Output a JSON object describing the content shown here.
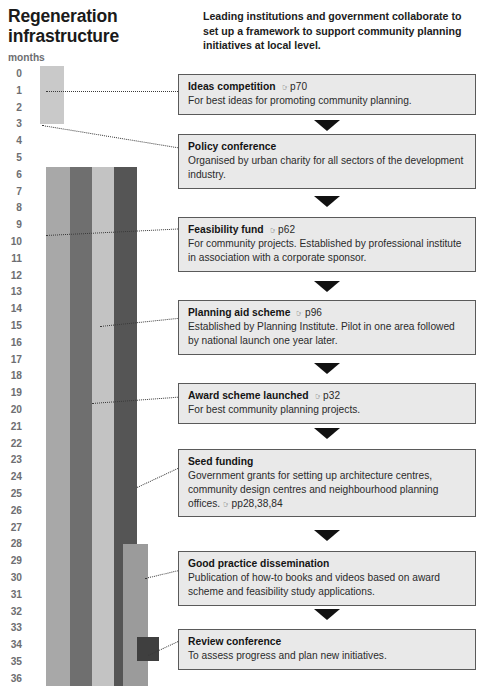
{
  "title": "Regeneration infrastructure",
  "intro": "Leading institutions and government collaborate to set up a framework to support community planning initiatives at local level.",
  "axis": {
    "label": "months",
    "ticks": [
      "0",
      "1",
      "2",
      "3",
      "4",
      "5",
      "6",
      "7",
      "8",
      "9",
      "10",
      "11",
      "12",
      "13",
      "14",
      "15",
      "16",
      "17",
      "18",
      "19",
      "20",
      "21",
      "22",
      "23",
      "24",
      "25",
      "26",
      "27",
      "28",
      "29",
      "30",
      "31",
      "32",
      "33",
      "34",
      "35",
      "36"
    ]
  },
  "icons": {
    "page_ref": "☞"
  },
  "colors": {
    "bar_light": "#c9c9c9",
    "bar_mid_light": "#a8a8a8",
    "bar_mid": "#9b9b9b",
    "bar_dark": "#6f6f6f",
    "bar_lightest": "#c3c3c3",
    "bar_darkest": "#555555",
    "box_fill": "#e9e9e9",
    "box_border": "#5a5a5a",
    "axis_text": "#6d6e71"
  },
  "chart_data": {
    "type": "bar",
    "title": "Regeneration infrastructure",
    "orientation": "vertical-timeline",
    "xlabel": "",
    "ylabel": "months",
    "ylim": [
      0,
      36
    ],
    "grid": false,
    "legend": "none",
    "categories": [
      "Ideas competition",
      "Policy conference",
      "Feasibility fund",
      "Planning aid scheme",
      "Award scheme launched",
      "Seed funding",
      "Good practice dissemination",
      "Review conference"
    ],
    "bars": [
      {
        "name": "Ideas competition",
        "start_month": 0,
        "end_month": 3,
        "duration_months": 3,
        "color": "#c9c9c9"
      },
      {
        "name": "Feasibility fund",
        "start_month": 6,
        "end_month": 36,
        "duration_months": 30,
        "color": "#a8a8a8"
      },
      {
        "name": "Planning aid scheme",
        "start_month": 6,
        "end_month": 36,
        "duration_months": 30,
        "color": "#6f6f6f"
      },
      {
        "name": "Award scheme launched",
        "start_month": 6,
        "end_month": 36,
        "duration_months": 30,
        "color": "#c3c3c3"
      },
      {
        "name": "Seed funding",
        "start_month": 6,
        "end_month": 36,
        "duration_months": 30,
        "color": "#555555"
      },
      {
        "name": "Good practice dissemination",
        "start_month": 28.5,
        "end_month": 36,
        "duration_months": 7.5,
        "color": "#9b9b9b"
      },
      {
        "name": "Review conference",
        "start_month": 34,
        "end_month": 35,
        "duration_months": 1,
        "color": "#3f3f3f"
      }
    ],
    "annotations": [
      {
        "label": "Ideas competition",
        "month": 1
      },
      {
        "label": "Policy conference",
        "month": 3
      },
      {
        "label": "Feasibility fund",
        "month": 9.5
      },
      {
        "label": "Planning aid scheme",
        "month": 15
      },
      {
        "label": "Award scheme launched",
        "month": 19.5
      },
      {
        "label": "Seed funding",
        "month": 24.5
      },
      {
        "label": "Good practice dissemination",
        "month": 30
      },
      {
        "label": "Review conference",
        "month": 34.5
      }
    ]
  },
  "items": [
    {
      "head": "Ideas competition",
      "ref": "p70",
      "body": "For best ideas for promoting community planning.",
      "body_ref": ""
    },
    {
      "head": "Policy conference",
      "ref": "",
      "body": "Organised by urban charity for all sectors of the development industry.",
      "body_ref": ""
    },
    {
      "head": "Feasibility fund",
      "ref": "p62",
      "body": "For community projects. Established by professional institute in association with a corporate sponsor.",
      "body_ref": ""
    },
    {
      "head": "Planning aid scheme",
      "ref": "p96",
      "body": "Established by Planning Institute. Pilot in one area followed by national launch one year later.",
      "body_ref": ""
    },
    {
      "head": "Award scheme launched",
      "ref": "p32",
      "body": "For best community planning projects.",
      "body_ref": ""
    },
    {
      "head": "Seed funding",
      "ref": "",
      "body": "Government grants for setting up architecture centres, community design centres and neighbourhood planning offices.",
      "body_ref": "pp28,38,84"
    },
    {
      "head": "Good practice dissemination",
      "ref": "",
      "body": "Publication of how-to books and videos based on award scheme and feasibility study applications.",
      "body_ref": ""
    },
    {
      "head": "Review conference",
      "ref": "",
      "body": "To assess progress and plan new initiatives.",
      "body_ref": ""
    }
  ]
}
